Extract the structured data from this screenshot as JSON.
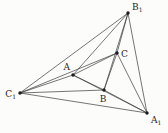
{
  "figure": {
    "name": "nested-triangles-diagram",
    "background": "#fcfcfb",
    "line_color": "#3b3b3b",
    "line_width": 0.7,
    "dot_color": "#1c1c1c",
    "dot_radius": 1.7,
    "label_color": "#1c1c1c",
    "width": 168,
    "height": 133,
    "points": [
      {
        "id": "B1",
        "label": "B",
        "sub": "1",
        "x": 128,
        "y": 13,
        "label_x": 132,
        "label_y": 10,
        "anchor": "start"
      },
      {
        "id": "C1",
        "label": "C",
        "sub": "1",
        "x": 20,
        "y": 93,
        "label_x": 16,
        "label_y": 97,
        "anchor": "end"
      },
      {
        "id": "A1",
        "label": "A",
        "sub": "1",
        "x": 147,
        "y": 113,
        "label_x": 151,
        "label_y": 123,
        "anchor": "start"
      },
      {
        "id": "A",
        "label": "A",
        "sub": "",
        "x": 73,
        "y": 75,
        "label_x": 70,
        "label_y": 70,
        "anchor": "end"
      },
      {
        "id": "B",
        "label": "B",
        "sub": "",
        "x": 104,
        "y": 90,
        "label_x": 103,
        "label_y": 102,
        "anchor": "middle"
      },
      {
        "id": "C",
        "label": "C",
        "sub": "",
        "x": 117,
        "y": 53,
        "label_x": 121,
        "label_y": 57,
        "anchor": "start"
      }
    ],
    "segments": [
      [
        "B1",
        "C1"
      ],
      [
        "C1",
        "A1"
      ],
      [
        "A1",
        "B1"
      ],
      [
        "A",
        "B"
      ],
      [
        "B",
        "C"
      ],
      [
        "C",
        "A"
      ],
      [
        "B1",
        "A"
      ],
      [
        "B1",
        "B"
      ],
      [
        "B1",
        "C"
      ],
      [
        "C1",
        "A"
      ],
      [
        "C1",
        "B"
      ],
      [
        "C1",
        "C"
      ],
      [
        "A1",
        "A"
      ],
      [
        "A1",
        "B"
      ],
      [
        "A1",
        "C"
      ]
    ]
  }
}
